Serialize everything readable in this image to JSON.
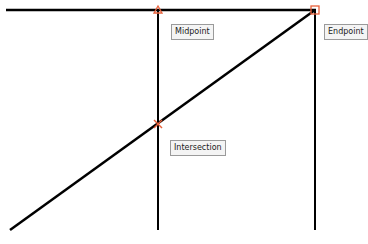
{
  "labels": {
    "midpoint": "Midpoint",
    "endpoint": "Endpoint",
    "intersection": "Intersection"
  },
  "colors": {
    "line": "#000000",
    "snap_marker": "#e8603a",
    "label_bg": "#f4f4f4",
    "label_border": "#9a9a9a"
  },
  "geometry": {
    "horizontal_line": {
      "x1": 6,
      "y1": 10,
      "x2": 316,
      "y2": 10
    },
    "vertical_line_mid": {
      "x1": 158,
      "y1": 10,
      "x2": 158,
      "y2": 230
    },
    "vertical_line_end": {
      "x1": 315,
      "y1": 10,
      "x2": 315,
      "y2": 230
    },
    "diagonal_line": {
      "x1": 10,
      "y1": 230,
      "x2": 315,
      "y2": 10
    },
    "midpoint_marker": {
      "x": 158,
      "y": 10
    },
    "endpoint_marker": {
      "x": 315,
      "y": 10
    },
    "intersection_marker": {
      "x": 158,
      "y": 124
    }
  }
}
